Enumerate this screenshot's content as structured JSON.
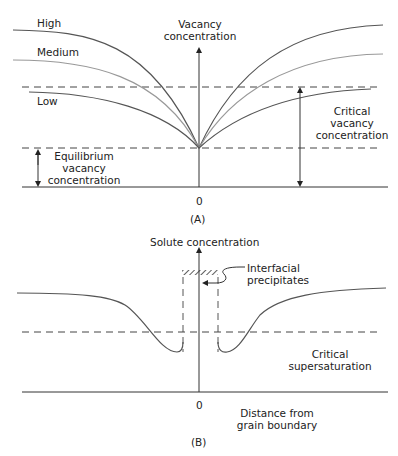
{
  "panel_a": {
    "caption": "(A)",
    "y_axis_label_line1": "Vacancy",
    "y_axis_label_line2": "concentration",
    "origin_label": "0",
    "curves": [
      {
        "name": "High",
        "color": "#555555"
      },
      {
        "name": "Medium",
        "color": "#999999"
      },
      {
        "name": "Low",
        "color": "#555555"
      }
    ],
    "critical_label": [
      "Critical",
      "vacancy",
      "concentration"
    ],
    "equilibrium_label": [
      "Equilibrium",
      "vacancy",
      "concentration"
    ]
  },
  "panel_b": {
    "caption": "(B)",
    "y_axis_label": "Solute concentration",
    "origin_label": "0",
    "precipitate_label": [
      "Interfacial",
      "precipitates"
    ],
    "critical_label": [
      "Critical",
      "supersaturation"
    ],
    "x_axis_label": [
      "Distance from",
      "grain boundary"
    ]
  }
}
